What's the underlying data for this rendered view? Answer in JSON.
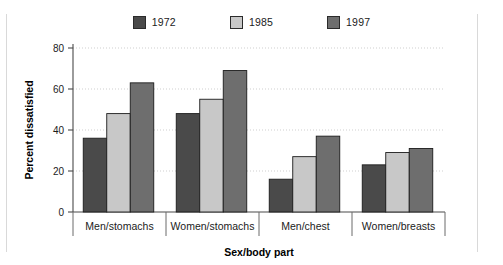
{
  "chart_data": {
    "type": "bar",
    "title": "",
    "subtitle": "",
    "xlabel": "Sex/body part",
    "ylabel": "Percent dissatisfied",
    "categories": [
      "Men/stomachs",
      "Women/stomachs",
      "Men/chest",
      "Women/breasts"
    ],
    "series": [
      {
        "name": "1972",
        "color": "#4a4a4a",
        "values": [
          36,
          48,
          16,
          23
        ]
      },
      {
        "name": "1985",
        "color": "#c8c8c8",
        "values": [
          48,
          55,
          27,
          29
        ]
      },
      {
        "name": "1997",
        "color": "#6e6e6e",
        "values": [
          63,
          69,
          37,
          31
        ]
      }
    ],
    "ylim": [
      0,
      80
    ],
    "yticks": [
      0,
      20,
      40,
      60,
      80
    ],
    "ytick_labels": [
      "0",
      "20",
      "40",
      "60",
      "80"
    ],
    "grid": true,
    "grid_axis": "y",
    "legend_position": "top-center",
    "annotations": []
  },
  "legend": {
    "entries": [
      {
        "label": "1972",
        "color": "#4a4a4a"
      },
      {
        "label": "1985",
        "color": "#c8c8c8"
      },
      {
        "label": "1997",
        "color": "#6e6e6e"
      }
    ]
  },
  "colors": {
    "axis": "#4a4a4a",
    "grid": "#cfcfcf",
    "frame": "#d9d9d9",
    "text": "#1b1b1b",
    "background": "#ffffff"
  }
}
